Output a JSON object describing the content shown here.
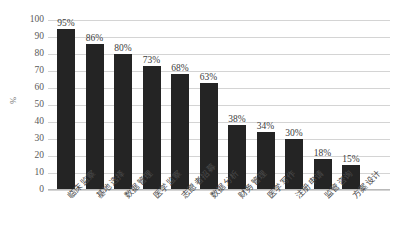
{
  "chart_data": {
    "type": "bar",
    "title": "",
    "xlabel": "",
    "ylabel": "%",
    "ylim": [
      0,
      100
    ],
    "ytick_step": 10,
    "grid": true,
    "legend": false,
    "orientation": "vertical",
    "bar_color": "#242424",
    "gridline_color": "#d4d4d4",
    "categories": [
      "临床监察",
      "基地选择",
      "数据管理",
      "医学监察",
      "志愿者招募",
      "数据分析",
      "财务管理",
      "医学写作",
      "注册申请",
      "监管咨询",
      "方案设计"
    ],
    "values": [
      95,
      86,
      80,
      73,
      68,
      63,
      38,
      34,
      30,
      18,
      15
    ],
    "data_labels": [
      "95%",
      "86%",
      "80%",
      "73%",
      "68%",
      "63%",
      "38%",
      "34%",
      "30%",
      "18%",
      "15%"
    ],
    "ytick_labels": [
      "100",
      "90",
      "80",
      "70",
      "60",
      "50",
      "40",
      "30",
      "20",
      "10",
      "0"
    ],
    "ytick_values": [
      100,
      90,
      80,
      70,
      60,
      50,
      40,
      30,
      20,
      10,
      0
    ]
  }
}
